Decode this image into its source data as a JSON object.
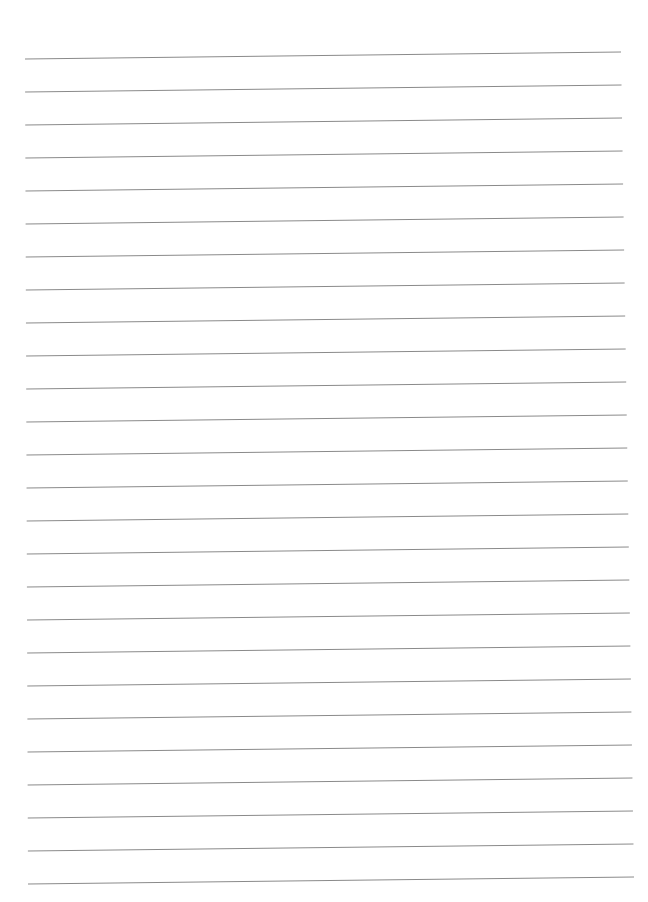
{
  "page": {
    "type": "lined-paper",
    "background_color": "#ffffff",
    "line_color": "#8a8a8a",
    "line_count": 26,
    "line_spacing_px": 33,
    "first_line_left_y": 59,
    "first_line_right_y": 52,
    "line_left_x_start": 25,
    "line_left_x_end": 28,
    "line_right_x_start": 621,
    "line_right_x_end": 634,
    "text_content": []
  }
}
